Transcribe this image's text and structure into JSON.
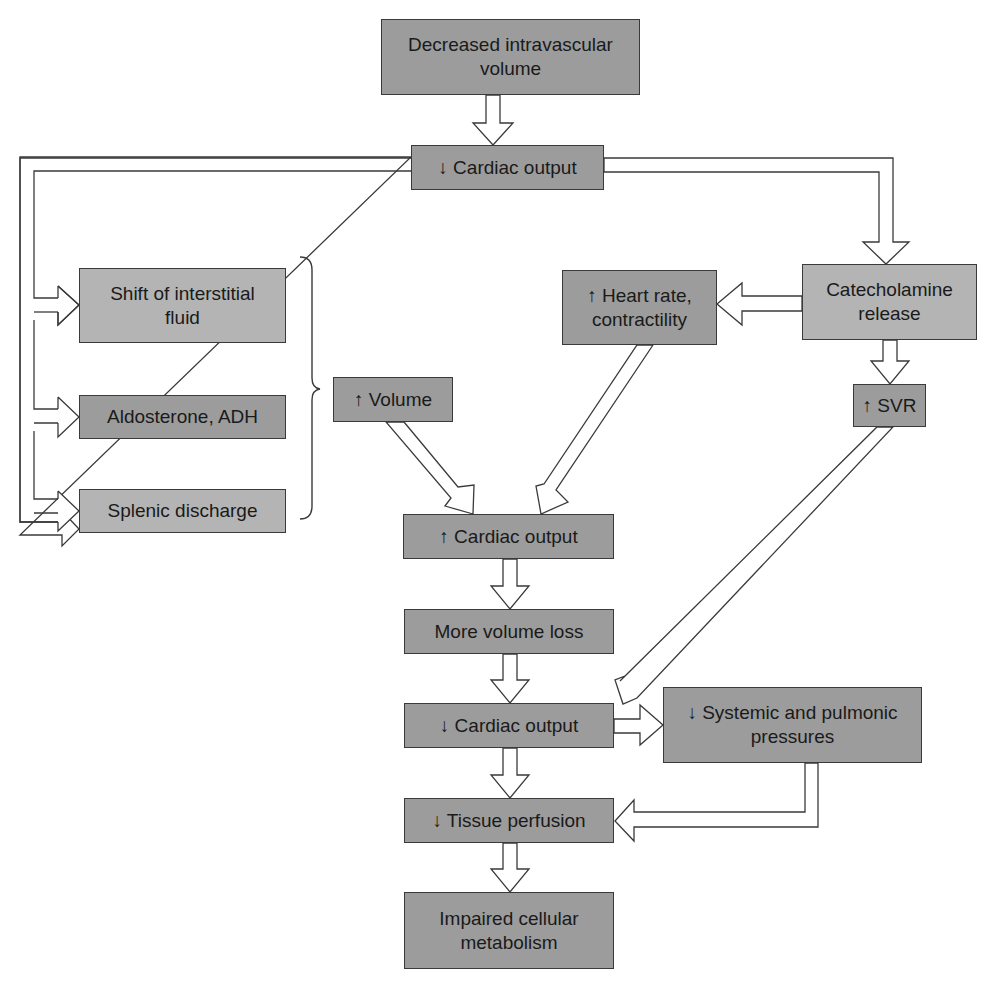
{
  "diagram": {
    "type": "flowchart",
    "colors": {
      "box_fill": "#9c9c9c",
      "box_fill_light": "#b4b4b4",
      "border": "#3a3a3a",
      "arrow_fill": "#ffffff"
    },
    "nodes": [
      {
        "id": "decreased_volume",
        "label": "Decreased intravascular\nvolume"
      },
      {
        "id": "co_down_1",
        "label": "↓ Cardiac output"
      },
      {
        "id": "shift_fluid",
        "label": "Shift of interstitial\nfluid"
      },
      {
        "id": "aldosterone",
        "label": "Aldosterone, ADH"
      },
      {
        "id": "splenic",
        "label": "Splenic discharge"
      },
      {
        "id": "volume_up",
        "label": "↑ Volume"
      },
      {
        "id": "hr_up",
        "label": "↑ Heart rate,\ncontractility"
      },
      {
        "id": "catecholamine",
        "label": "Catecholamine\nrelease"
      },
      {
        "id": "svr_up",
        "label": "↑ SVR"
      },
      {
        "id": "co_up",
        "label": "↑ Cardiac output"
      },
      {
        "id": "more_loss",
        "label": "More volume loss"
      },
      {
        "id": "co_down_2",
        "label": "↓ Cardiac output"
      },
      {
        "id": "pressures_down",
        "label": "↓ Systemic and pulmonic\npressures"
      },
      {
        "id": "perfusion_down",
        "label": "↓ Tissue perfusion"
      },
      {
        "id": "impaired",
        "label": "Impaired cellular\nmetabolism"
      }
    ],
    "edges": [
      [
        "decreased_volume",
        "co_down_1"
      ],
      [
        "co_down_1",
        "shift_fluid"
      ],
      [
        "co_down_1",
        "aldosterone"
      ],
      [
        "co_down_1",
        "splenic"
      ],
      [
        "co_down_1",
        "catecholamine"
      ],
      [
        "catecholamine",
        "hr_up"
      ],
      [
        "catecholamine",
        "svr_up"
      ],
      [
        "shift_fluid+aldosterone+splenic",
        "volume_up"
      ],
      [
        "volume_up",
        "co_up"
      ],
      [
        "hr_up",
        "co_up"
      ],
      [
        "co_up",
        "more_loss"
      ],
      [
        "more_loss",
        "co_down_2"
      ],
      [
        "svr_up",
        "co_down_2"
      ],
      [
        "co_down_2",
        "pressures_down"
      ],
      [
        "co_down_2",
        "perfusion_down"
      ],
      [
        "pressures_down",
        "perfusion_down"
      ],
      [
        "perfusion_down",
        "impaired"
      ]
    ]
  }
}
